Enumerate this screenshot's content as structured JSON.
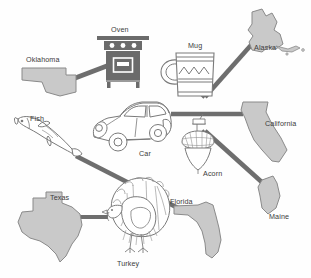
{
  "diagram": {
    "type": "matching-connection-diagram",
    "background_color": "#fefefe",
    "line_color": "#6e6e6e",
    "state_fill": "#c9c9c9",
    "state_stroke": "#8a8a8a",
    "object_stroke": "#7a7a7a",
    "oven_fill": "#6b6b6b",
    "label_color": "#3b3b3b"
  },
  "labels": {
    "oklahoma": "Oklahoma",
    "oven": "Oven",
    "mug": "Mug",
    "alaska": "Alaska",
    "california": "California",
    "fish": "Fish",
    "car": "Car",
    "acorn": "Acorn",
    "texas": "Texas",
    "florida": "Florida",
    "maine": "Maine",
    "turkey": "Turkey"
  },
  "states": [
    {
      "name": "Oklahoma",
      "label": "Oklahoma"
    },
    {
      "name": "Alaska",
      "label": "Alaska"
    },
    {
      "name": "California",
      "label": "California"
    },
    {
      "name": "Texas",
      "label": "Texas"
    },
    {
      "name": "Florida",
      "label": "Florida"
    },
    {
      "name": "Maine",
      "label": "Maine"
    }
  ],
  "objects": [
    {
      "name": "Oven",
      "label": "Oven"
    },
    {
      "name": "Mug",
      "label": "Mug"
    },
    {
      "name": "Fish",
      "label": "Fish"
    },
    {
      "name": "Car",
      "label": "Car"
    },
    {
      "name": "Acorn",
      "label": "Acorn"
    },
    {
      "name": "Turkey",
      "label": "Turkey"
    }
  ],
  "connections": [
    {
      "from": "Oklahoma",
      "to": "Oven"
    },
    {
      "from": "Alaska",
      "to": "Mug"
    },
    {
      "from": "California",
      "to": "Car"
    },
    {
      "from": "Maine",
      "to": "Acorn"
    },
    {
      "from": "Florida",
      "to": "Fish"
    },
    {
      "from": "Texas",
      "to": "Turkey"
    }
  ]
}
